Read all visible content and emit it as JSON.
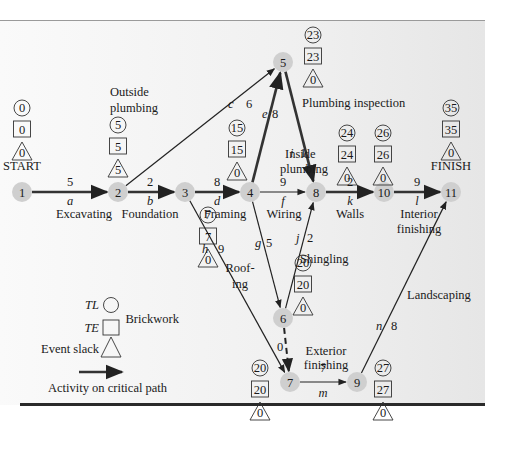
{
  "colors": {
    "node_fill": "#cfcfcf",
    "critical_line": "#333333",
    "normal_line": "#222222",
    "panel_bg": "#f2f2f2"
  },
  "start_label": "START",
  "finish_label": "FINISH",
  "nodes": [
    {
      "id": "1",
      "x": 22,
      "y": 192,
      "TL": "0",
      "TE": "0",
      "slack": "0",
      "box_x": 22,
      "box_y": 108
    },
    {
      "id": "2",
      "x": 118,
      "y": 192,
      "TL": "5",
      "TE": "5",
      "slack": "5",
      "box_x": 118,
      "box_y": 125
    },
    {
      "id": "3",
      "x": 185,
      "y": 192,
      "TL": "7",
      "TE": "7",
      "slack": "0",
      "box_x": 208,
      "box_y": 215
    },
    {
      "id": "4",
      "x": 250,
      "y": 192,
      "TL": "15",
      "TE": "15",
      "slack": "0",
      "box_x": 237,
      "box_y": 128
    },
    {
      "id": "5",
      "x": 283,
      "y": 62,
      "TL": "23",
      "TE": "23",
      "slack": "0",
      "box_x": 313,
      "box_y": 35
    },
    {
      "id": "6",
      "x": 283,
      "y": 318,
      "TL": "20",
      "TE": "20",
      "slack": "0",
      "box_x": 303,
      "box_y": 263
    },
    {
      "id": "7",
      "x": 290,
      "y": 382,
      "TL": "20",
      "TE": "20",
      "slack": "0",
      "box_x": 260,
      "box_y": 368
    },
    {
      "id": "8",
      "x": 316,
      "y": 192,
      "TL": "24",
      "TE": "24",
      "slack": "0",
      "box_x": 347,
      "box_y": 133
    },
    {
      "id": "9",
      "x": 357,
      "y": 382,
      "TL": "27",
      "TE": "27",
      "slack": "0",
      "box_x": 383,
      "box_y": 368
    },
    {
      "id": "10",
      "x": 384,
      "y": 192,
      "TL": "26",
      "TE": "26",
      "slack": "0",
      "box_x": 383,
      "box_y": 133
    },
    {
      "id": "11",
      "x": 451,
      "y": 192,
      "TL": "35",
      "TE": "35",
      "slack": "0",
      "box_x": 451,
      "box_y": 108
    }
  ],
  "activities": [
    {
      "from": "1",
      "to": "2",
      "letter": "a",
      "duration": "5",
      "name": "Excavating",
      "critical": true
    },
    {
      "from": "2",
      "to": "3",
      "letter": "b",
      "duration": "2",
      "name": "Foundation",
      "critical": true
    },
    {
      "from": "2",
      "to": "5",
      "letter": "c",
      "duration": "6",
      "name": "Outside plumbing",
      "critical": false
    },
    {
      "from": "3",
      "to": "4",
      "letter": "d",
      "duration": "8",
      "name": "Framing",
      "critical": true
    },
    {
      "from": "4",
      "to": "5",
      "letter": "e",
      "duration": "8",
      "name": "Inside plumbing",
      "critical": true
    },
    {
      "from": "4",
      "to": "8",
      "letter": "f",
      "duration": "9",
      "name": "Wiring",
      "critical": false
    },
    {
      "from": "4",
      "to": "6",
      "letter": "g",
      "duration": "5",
      "name": "Roofing",
      "critical": false
    },
    {
      "from": "3",
      "to": "7",
      "letter": "h",
      "duration": "9",
      "name": "Brickwork",
      "critical": false
    },
    {
      "from": "5",
      "to": "8",
      "letter": "i",
      "duration": "1",
      "name": "Plumbing inspection",
      "critical": true
    },
    {
      "from": "6",
      "to": "8",
      "letter": "j",
      "duration": "2",
      "name": "Shingling",
      "critical": false
    },
    {
      "from": "8",
      "to": "10",
      "letter": "k",
      "duration": "2",
      "name": "Walls",
      "critical": true
    },
    {
      "from": "10",
      "to": "11",
      "letter": "l",
      "duration": "9",
      "name": "Interior finishing",
      "critical": true
    },
    {
      "from": "7",
      "to": "9",
      "letter": "m",
      "duration": "7",
      "name": "Exterior finishing",
      "critical": false
    },
    {
      "from": "9",
      "to": "11",
      "letter": "n",
      "duration": "8",
      "name": "Landscaping",
      "critical": false
    },
    {
      "from": "6",
      "to": "7",
      "letter": "",
      "duration": "0",
      "name": "dummy",
      "critical": false,
      "dashed": true
    }
  ],
  "labels": {
    "outside_plumbing_1": "Outside",
    "outside_plumbing_2": "plumbing",
    "inside_plumbing_1": "Inside",
    "inside_plumbing_2": "plumbing",
    "plumbing_inspection": "Plumbing inspection",
    "excavating": "Excavating",
    "foundation": "Foundation",
    "framing": "Framing",
    "wiring": "Wiring",
    "walls": "Walls",
    "interior_1": "Interior",
    "interior_2": "finishing",
    "roofing_1": "Roof-",
    "roofing_2": "ing",
    "shingling": "Shingling",
    "brickwork": "Brickwork",
    "exterior_1": "Exterior",
    "exterior_2": "finishing",
    "landscaping": "Landscaping"
  },
  "legend": {
    "tl_label": "TL",
    "te_label": "TE",
    "slack_label": "Event slack",
    "critical_label": "Activity on critical path"
  }
}
